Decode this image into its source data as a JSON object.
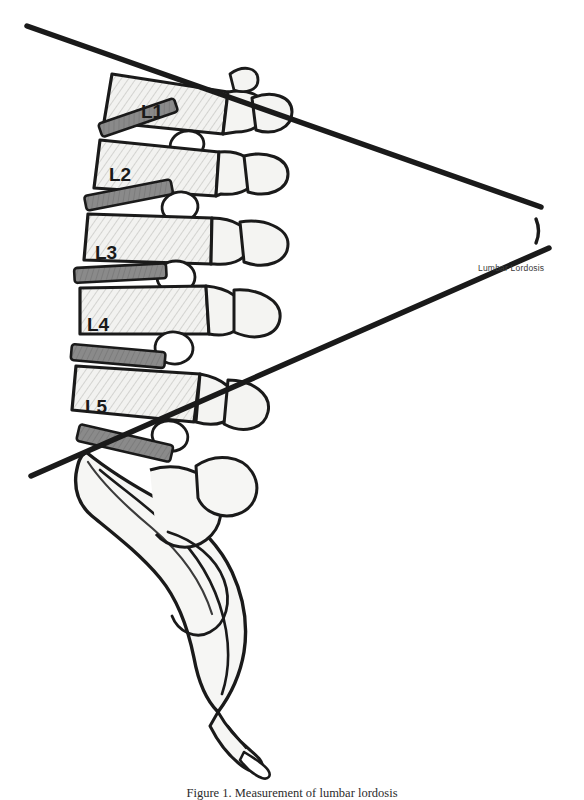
{
  "figure": {
    "background_color": "#ffffff",
    "line_color": "#1a1a1a",
    "bone_fill_color": "#f2f2f0",
    "disc_fill_color": "#8a8a8a",
    "shade_color": "#9a9a9a"
  },
  "vertebrae": [
    {
      "label": "L1",
      "x": 152,
      "y": 118
    },
    {
      "label": "L2",
      "x": 120,
      "y": 181
    },
    {
      "label": "L3",
      "x": 106,
      "y": 259
    },
    {
      "label": "L4",
      "x": 98,
      "y": 331
    },
    {
      "label": "L5",
      "x": 96,
      "y": 413
    }
  ],
  "measurement": {
    "angle_label": "Lumbar Lordosis",
    "angle_label_x": 478,
    "angle_label_y": 270,
    "vertex_x": 508,
    "vertex_y": 230,
    "upper_line": {
      "x1": 27,
      "y1": 26,
      "x2": 541,
      "y2": 207
    },
    "lower_line": {
      "x1": 31,
      "y1": 476,
      "x2": 549,
      "y2": 248
    },
    "line_width": 5.5,
    "arc_radius": 30
  },
  "discs": [
    {
      "between": "L1-L2",
      "x": 98,
      "y": 130,
      "width": 76,
      "height": 13,
      "rotate": -20
    },
    {
      "between": "L2-L3",
      "x": 84,
      "y": 200,
      "width": 84,
      "height": 14,
      "rotate": -13
    },
    {
      "between": "L3-L4",
      "x": 74,
      "y": 272,
      "width": 90,
      "height": 14,
      "rotate": -5
    },
    {
      "between": "L4-L5",
      "x": 72,
      "y": 350,
      "width": 92,
      "height": 15,
      "rotate": 4
    },
    {
      "between": "L5-S1",
      "x": 80,
      "y": 430,
      "width": 94,
      "height": 16,
      "rotate": 14
    }
  ],
  "caption": {
    "clipped_text": "Figure 1. Measurement of lumbar lordosis"
  }
}
